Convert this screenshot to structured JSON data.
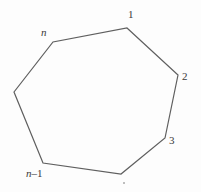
{
  "page": {
    "background": "#fdfdfd"
  },
  "diagram": {
    "type": "polygon",
    "stroke_color": "#5f5f5f",
    "label_color": "#3a3a3a",
    "vertex_labels": {
      "top_right": "1",
      "right": "2",
      "bottom_right": "3",
      "bottom_left_prefix": "n",
      "bottom_left_suffix": "–1",
      "top_left": "n"
    }
  }
}
